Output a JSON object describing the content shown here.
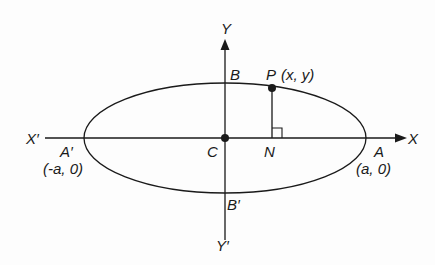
{
  "diagram": {
    "type": "ellipse-coordinate-diagram",
    "colors": {
      "stroke": "#1a1a1a",
      "background": "#fdfdfd"
    },
    "axes": {
      "x_positive_label": "X",
      "x_negative_label": "X′",
      "y_positive_label": "Y",
      "y_negative_label": "Y′"
    },
    "points": {
      "center": {
        "label": "C"
      },
      "vertex_right": {
        "label": "A",
        "coords": "(a, 0)"
      },
      "vertex_left": {
        "label": "A′",
        "coords": "(-a, 0)"
      },
      "co_vertex_top": {
        "label": "B"
      },
      "co_vertex_bottom": {
        "label": "B′"
      },
      "point_on_ellipse": {
        "label": "P",
        "coords": "(x, y)"
      },
      "foot_of_perpendicular": {
        "label": "N"
      }
    }
  }
}
